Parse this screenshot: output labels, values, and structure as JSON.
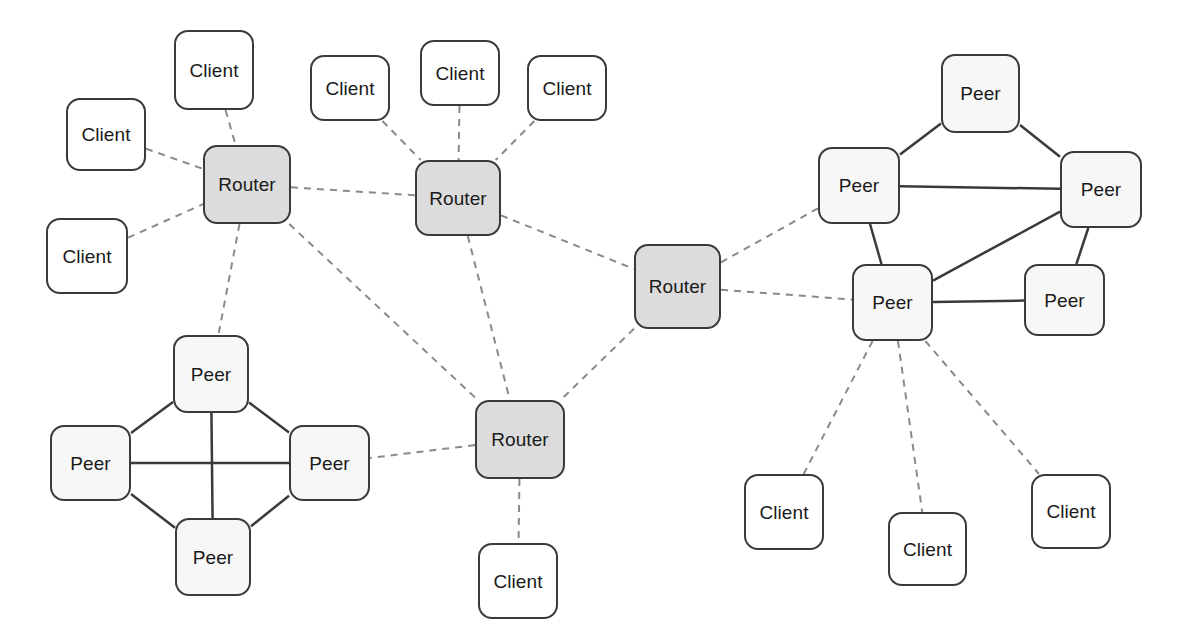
{
  "diagram": {
    "width": 1179,
    "height": 640,
    "background": "#ffffff",
    "node_types": {
      "client": {
        "label": "Client",
        "fill": "#ffffff",
        "stroke": "#3a3a3a"
      },
      "peer": {
        "label": "Peer",
        "fill": "#f7f7f7",
        "stroke": "#3a3a3a"
      },
      "router": {
        "label": "Router",
        "fill": "#dcdcdc",
        "stroke": "#3a3a3a"
      }
    },
    "edge_styles": {
      "dashed": {
        "stroke": "#8a8a8a",
        "width": 2,
        "dash": "7 6"
      },
      "solid": {
        "stroke": "#3a3a3a",
        "width": 2.5,
        "dash": "none"
      }
    },
    "nodes": [
      {
        "id": "client-l1",
        "type": "client",
        "label": "Client",
        "x": 174,
        "y": 30,
        "w": 80,
        "h": 80
      },
      {
        "id": "client-l2",
        "type": "client",
        "label": "Client",
        "x": 66,
        "y": 98,
        "w": 80,
        "h": 73
      },
      {
        "id": "client-l3",
        "type": "client",
        "label": "Client",
        "x": 46,
        "y": 218,
        "w": 82,
        "h": 76
      },
      {
        "id": "client-m1",
        "type": "client",
        "label": "Client",
        "x": 310,
        "y": 55,
        "w": 80,
        "h": 66
      },
      {
        "id": "client-m2",
        "type": "client",
        "label": "Client",
        "x": 420,
        "y": 40,
        "w": 80,
        "h": 66
      },
      {
        "id": "client-m3",
        "type": "client",
        "label": "Client",
        "x": 527,
        "y": 55,
        "w": 80,
        "h": 66
      },
      {
        "id": "router-1",
        "type": "router",
        "label": "Router",
        "x": 203,
        "y": 145,
        "w": 88,
        "h": 79
      },
      {
        "id": "router-2",
        "type": "router",
        "label": "Router",
        "x": 415,
        "y": 160,
        "w": 86,
        "h": 76
      },
      {
        "id": "router-3",
        "type": "router",
        "label": "Router",
        "x": 634,
        "y": 244,
        "w": 87,
        "h": 85
      },
      {
        "id": "router-4",
        "type": "router",
        "label": "Router",
        "x": 475,
        "y": 400,
        "w": 90,
        "h": 79
      },
      {
        "id": "client-r4",
        "type": "client",
        "label": "Client",
        "x": 478,
        "y": 543,
        "w": 80,
        "h": 76
      },
      {
        "id": "peer-lt",
        "type": "peer",
        "label": "Peer",
        "x": 173,
        "y": 335,
        "w": 76,
        "h": 78
      },
      {
        "id": "peer-ll",
        "type": "peer",
        "label": "Peer",
        "x": 50,
        "y": 425,
        "w": 81,
        "h": 76
      },
      {
        "id": "peer-lr",
        "type": "peer",
        "label": "Peer",
        "x": 289,
        "y": 425,
        "w": 81,
        "h": 76
      },
      {
        "id": "peer-lb",
        "type": "peer",
        "label": "Peer",
        "x": 175,
        "y": 518,
        "w": 76,
        "h": 78
      },
      {
        "id": "peer-rt",
        "type": "peer",
        "label": "Peer",
        "x": 941,
        "y": 54,
        "w": 79,
        "h": 79
      },
      {
        "id": "peer-rl",
        "type": "peer",
        "label": "Peer",
        "x": 818,
        "y": 147,
        "w": 82,
        "h": 77
      },
      {
        "id": "peer-rr",
        "type": "peer",
        "label": "Peer",
        "x": 1060,
        "y": 151,
        "w": 82,
        "h": 77
      },
      {
        "id": "peer-rbl",
        "type": "peer",
        "label": "Peer",
        "x": 852,
        "y": 264,
        "w": 81,
        "h": 77
      },
      {
        "id": "peer-rbr",
        "type": "peer",
        "label": "Peer",
        "x": 1024,
        "y": 264,
        "w": 81,
        "h": 72
      },
      {
        "id": "client-b1",
        "type": "client",
        "label": "Client",
        "x": 744,
        "y": 474,
        "w": 80,
        "h": 76
      },
      {
        "id": "client-b2",
        "type": "client",
        "label": "Client",
        "x": 888,
        "y": 512,
        "w": 79,
        "h": 74
      },
      {
        "id": "client-b3",
        "type": "client",
        "label": "Client",
        "x": 1031,
        "y": 474,
        "w": 80,
        "h": 75
      }
    ],
    "edges": [
      {
        "from": "client-l1",
        "to": "router-1",
        "style": "dashed"
      },
      {
        "from": "client-l2",
        "to": "router-1",
        "style": "dashed"
      },
      {
        "from": "client-l3",
        "to": "router-1",
        "style": "dashed"
      },
      {
        "from": "client-m1",
        "to": "router-2",
        "style": "dashed"
      },
      {
        "from": "client-m2",
        "to": "router-2",
        "style": "dashed"
      },
      {
        "from": "client-m3",
        "to": "router-2",
        "style": "dashed"
      },
      {
        "from": "router-1",
        "to": "router-2",
        "style": "dashed"
      },
      {
        "from": "router-1",
        "to": "peer-lt",
        "style": "dashed"
      },
      {
        "from": "router-1",
        "to": "router-4",
        "style": "dashed"
      },
      {
        "from": "router-2",
        "to": "router-3",
        "style": "dashed"
      },
      {
        "from": "router-2",
        "to": "router-4",
        "style": "dashed"
      },
      {
        "from": "router-3",
        "to": "router-4",
        "style": "dashed"
      },
      {
        "from": "router-3",
        "to": "peer-rl",
        "style": "dashed"
      },
      {
        "from": "router-3",
        "to": "peer-rbl",
        "style": "dashed"
      },
      {
        "from": "router-4",
        "to": "peer-lr",
        "style": "dashed"
      },
      {
        "from": "router-4",
        "to": "client-r4",
        "style": "dashed"
      },
      {
        "from": "peer-lt",
        "to": "peer-ll",
        "style": "solid"
      },
      {
        "from": "peer-lt",
        "to": "peer-lr",
        "style": "solid"
      },
      {
        "from": "peer-lt",
        "to": "peer-lb",
        "style": "solid"
      },
      {
        "from": "peer-ll",
        "to": "peer-lr",
        "style": "solid"
      },
      {
        "from": "peer-ll",
        "to": "peer-lb",
        "style": "solid"
      },
      {
        "from": "peer-lr",
        "to": "peer-lb",
        "style": "solid"
      },
      {
        "from": "peer-rt",
        "to": "peer-rl",
        "style": "solid"
      },
      {
        "from": "peer-rt",
        "to": "peer-rr",
        "style": "solid"
      },
      {
        "from": "peer-rl",
        "to": "peer-rr",
        "style": "solid"
      },
      {
        "from": "peer-rl",
        "to": "peer-rbl",
        "style": "solid"
      },
      {
        "from": "peer-rr",
        "to": "peer-rbl",
        "style": "solid"
      },
      {
        "from": "peer-rr",
        "to": "peer-rbr",
        "style": "solid"
      },
      {
        "from": "peer-rbl",
        "to": "peer-rbr",
        "style": "solid"
      },
      {
        "from": "peer-rbl",
        "to": "client-b1",
        "style": "dashed"
      },
      {
        "from": "peer-rbl",
        "to": "client-b2",
        "style": "dashed"
      },
      {
        "from": "peer-rbl",
        "to": "client-b3",
        "style": "dashed"
      }
    ]
  }
}
